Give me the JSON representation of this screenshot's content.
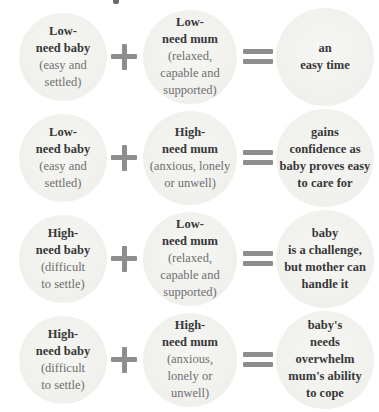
{
  "colors": {
    "background": "#ffffff",
    "circle_fill": "#f1f1ee",
    "bold_text": "#383838",
    "muted_text": "#6f6f6f",
    "operator_gray": "#8d8d8d"
  },
  "icons": {
    "plus": "+",
    "equals": "="
  },
  "rows": [
    {
      "baby": {
        "title": "Low-\nneed baby",
        "subtitle": "(easy and\nsettled)"
      },
      "mum": {
        "title": "Low-\nneed mum",
        "subtitle": "(relaxed,\ncapable and\nsupported)"
      },
      "result": "an\neasy time"
    },
    {
      "baby": {
        "title": "Low-\nneed baby",
        "subtitle": "(easy and\nsettled)"
      },
      "mum": {
        "title": "High-\nneed mum",
        "subtitle": "(anxious, lonely\nor unwell)"
      },
      "result": "gains\nconfidence as\nbaby proves easy\nto care for"
    },
    {
      "baby": {
        "title": "High-\nneed baby",
        "subtitle": "(difficult\nto settle)"
      },
      "mum": {
        "title": "Low-\nneed mum",
        "subtitle": "(relaxed,\ncapable and\nsupported)"
      },
      "result": "baby\nis a challenge,\nbut mother can\nhandle it"
    },
    {
      "baby": {
        "title": "High-\nneed baby",
        "subtitle": "(difficult\nto settle)"
      },
      "mum": {
        "title": "High-\nneed mum",
        "subtitle": "(anxious,\nlonely or\nunwell)"
      },
      "result": "baby's\nneeds\noverwhelm\nmum's ability\nto cope"
    }
  ]
}
